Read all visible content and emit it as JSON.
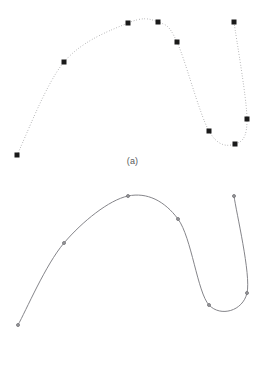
{
  "figure": {
    "background_color": "#ffffff",
    "width": 265,
    "height": 369
  },
  "panels": [
    {
      "id": "a",
      "caption": "(a)",
      "marker_shape": "square",
      "marker_color": "#1a1a1a",
      "marker_size": 5,
      "curve_style": "dotted",
      "curve_color": "#8c8c8e",
      "curve_width": 1
    },
    {
      "id": "b",
      "caption": "(b)",
      "marker_shape": "circle",
      "marker_color": "#6e6e72",
      "marker_size": 3,
      "curve_style": "solid",
      "curve_color": "#85858a",
      "curve_width": 1
    }
  ],
  "chart_data": {
    "type": "scatter",
    "title": "",
    "subtitle": "",
    "xlabel": "",
    "ylabel": "",
    "grid": false,
    "legend": "none",
    "axes_visible": false,
    "xlim": [
      0,
      265
    ],
    "ylim": [
      0,
      180
    ],
    "series": [
      {
        "name": "panel-a-control-points",
        "panel": "a",
        "marker": "square",
        "line": "dotted",
        "x": [
          17,
          64,
          128,
          158,
          177,
          209,
          235,
          247,
          234
        ],
        "y": [
          155,
          62,
          23,
          22,
          42,
          131,
          144,
          119,
          22
        ]
      },
      {
        "name": "panel-b-control-points",
        "panel": "b",
        "marker": "circle",
        "line": "solid",
        "x": [
          18,
          64,
          128,
          178,
          209,
          247,
          234
        ],
        "y": [
          145,
          63,
          16,
          39,
          125,
          113,
          16
        ]
      }
    ]
  }
}
